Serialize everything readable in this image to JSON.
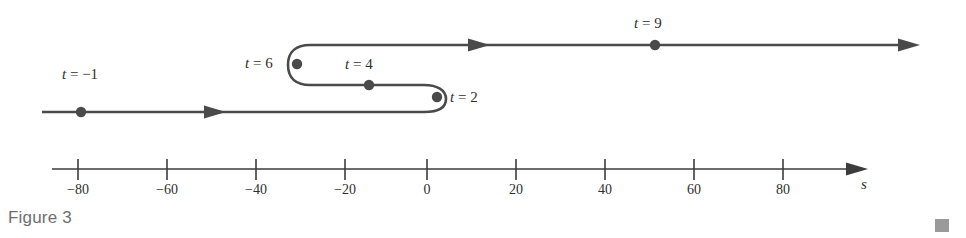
{
  "figure": {
    "caption": "Figure 3",
    "axis_name": "s",
    "line_color": "#4a4a4a",
    "dot_color": "#4a4a4a",
    "axis_color": "#3c3c3c",
    "caption_color": "#6e6e6e",
    "corner_mark_color": "#9a9a9a",
    "background": "#ffffff"
  },
  "time_labels": [
    {
      "id": "t-minus-1",
      "text": "t = −1"
    },
    {
      "id": "t-6",
      "text": "t = 6"
    },
    {
      "id": "t-4",
      "text": "t = 4"
    },
    {
      "id": "t-2",
      "text": "t = 2"
    },
    {
      "id": "t-9",
      "text": "t = 9"
    }
  ],
  "axis": {
    "ticks": [
      "−80",
      "−60",
      "−40",
      "−20",
      "0",
      "20",
      "40",
      "60",
      "80"
    ]
  },
  "chart_data": {
    "type": "line",
    "title": "Figure 3",
    "xlabel": "s",
    "ylabel": "",
    "xlim": [
      -88,
      90
    ],
    "grid": false,
    "legend": null,
    "axis_ticks": [
      -80,
      -60,
      -40,
      -20,
      0,
      20,
      40,
      60,
      80
    ],
    "annotations": [
      {
        "label": "t = −1",
        "s": -73,
        "direction": "right"
      },
      {
        "label": "t = 2",
        "s": 2,
        "direction": "reversal"
      },
      {
        "label": "t = 4",
        "s": -13,
        "direction": "left"
      },
      {
        "label": "t = 6",
        "s": -29,
        "direction": "reversal"
      },
      {
        "label": "t = 9",
        "s": 51,
        "direction": "right"
      }
    ],
    "series": [
      {
        "name": "particle path",
        "points": [
          {
            "t": -1,
            "s": -73
          },
          {
            "t": 2,
            "s": 2
          },
          {
            "t": 4,
            "s": -13
          },
          {
            "t": 6,
            "s": -29
          },
          {
            "t": 9,
            "s": 51
          }
        ]
      }
    ]
  }
}
